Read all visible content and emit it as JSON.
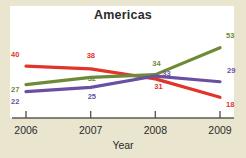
{
  "chart_data": {
    "type": "line",
    "title": "Americas",
    "xlabel": "Year",
    "ylabel": "",
    "categories": [
      "2006",
      "2007",
      "2008",
      "2009"
    ],
    "x": [
      2006,
      2007,
      2008,
      2009
    ],
    "xlim": [
      2006,
      2009
    ],
    "ylim": [
      14,
      57
    ],
    "grid": false,
    "legend": "none",
    "axis": {
      "y_visible": false,
      "x_visible": true
    },
    "series": [
      {
        "name": "red-series",
        "color": "#e0352b",
        "values": [
          40,
          38,
          31,
          18
        ],
        "labels": [
          "40",
          "38",
          "31",
          "18"
        ]
      },
      {
        "name": "green-series",
        "color": "#6d8a38",
        "values": [
          27,
          32,
          34,
          53
        ],
        "labels": [
          "27",
          "32",
          "34",
          "53"
        ]
      },
      {
        "name": "purple-series",
        "color": "#6a4fa3",
        "values": [
          22,
          25,
          33,
          29
        ],
        "labels": [
          "22",
          "25",
          "33",
          "29"
        ]
      }
    ]
  },
  "colors": {
    "page_background": "#e9e5cf",
    "plot_background": "#ffffff",
    "axis": "#5a5a52",
    "title_text": "#2b2b2b",
    "red": "#e0352b",
    "green": "#6d8a38",
    "purple": "#6a4fa3"
  }
}
